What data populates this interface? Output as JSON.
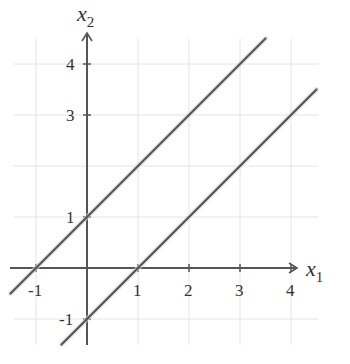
{
  "chart_data": {
    "type": "line",
    "title": "",
    "xlabel": "x1",
    "ylabel": "x2",
    "xlabel_main": "x",
    "xlabel_sub": "1",
    "ylabel_main": "x",
    "ylabel_sub": "2",
    "xlim": [
      -1.5,
      4.5
    ],
    "ylim": [
      -1.5,
      4.5
    ],
    "grid": true,
    "x_ticks": [
      -1,
      1,
      2,
      3,
      4
    ],
    "y_ticks": [
      -1,
      1,
      3,
      4
    ],
    "x_tick_labels": [
      "-1",
      "1",
      "2",
      "3",
      "4"
    ],
    "y_tick_labels": [
      "-1",
      "1",
      "3",
      "4"
    ],
    "series": [
      {
        "name": "x2 = x1 + 1",
        "x": [
          -1.5,
          3.5
        ],
        "y": [
          -0.5,
          4.5
        ],
        "intercepts": {
          "x": -1,
          "y": 1
        }
      },
      {
        "name": "x2 = x1 - 1",
        "x": [
          -0.5,
          4.5
        ],
        "y": [
          -1.5,
          3.5
        ],
        "intercepts": {
          "x": 1,
          "y": -1
        }
      }
    ],
    "colors": {
      "line": "#555555",
      "axis": "#555555",
      "grid": "#e4e4e4",
      "text": "#333333"
    }
  }
}
